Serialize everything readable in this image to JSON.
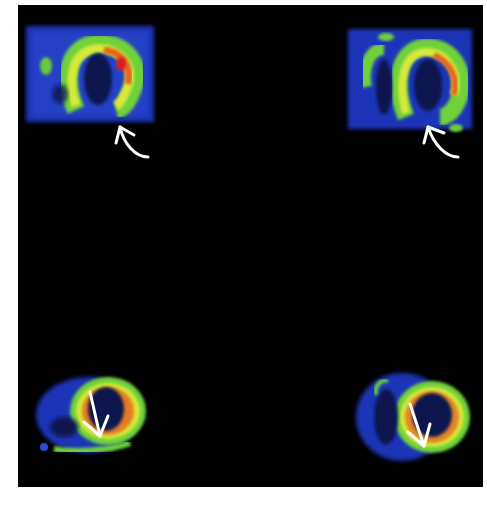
{
  "figure": {
    "background": "#000000",
    "colors": {
      "low": "#1a2fb0",
      "mid_low": "#2f5fd8",
      "mid": "#6fd23a",
      "mid_high": "#d8e83a",
      "high": "#e8641e",
      "peak": "#d81e1e",
      "arrow": "#ffffff"
    },
    "panels": [
      {
        "position": "top-left",
        "view": "long-axis",
        "arrow": "curved-arrow-up-left",
        "label": ""
      },
      {
        "position": "top-right",
        "view": "long-axis",
        "arrow": "curved-arrow-up-left",
        "label": ""
      },
      {
        "position": "bottom-left",
        "view": "short-axis",
        "arrow": "straight-arrow-down",
        "label": ""
      },
      {
        "position": "bottom-right",
        "view": "short-axis",
        "arrow": "straight-arrow-down",
        "label": ""
      }
    ]
  }
}
